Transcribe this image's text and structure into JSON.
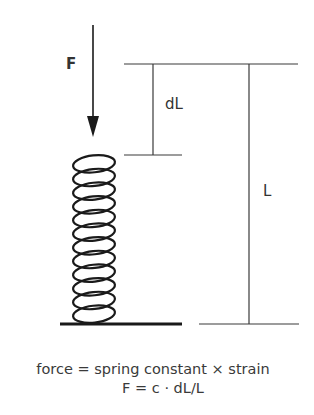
{
  "diagram": {
    "labels": {
      "force": "F",
      "delta_length": "dL",
      "length": "L"
    },
    "caption": {
      "line1": "force = spring constant × strain",
      "line2": "F = c · dL/L"
    },
    "spring": {
      "coils": 12
    },
    "colors": {
      "stroke": "#1a1a1a",
      "dimension_lines": "#3a3a3a",
      "text": "#333333",
      "background": "#ffffff"
    }
  }
}
